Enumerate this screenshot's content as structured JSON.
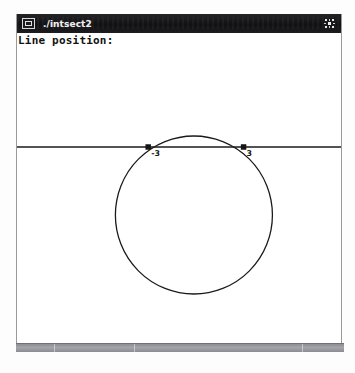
{
  "window": {
    "title": "./intsect2",
    "sysmenu_icon": "window-restore-icon",
    "close_icon": "close-icon",
    "close_label": "X"
  },
  "canvas": {
    "status_label": "Line position:",
    "background_color": "#ffffff",
    "stroke_color": "#1a1a1a"
  },
  "chart_data": {
    "type": "scatter",
    "title": "Line position:",
    "xlabel": "",
    "ylabel": "",
    "grid": false,
    "legend": false,
    "shapes": [
      {
        "kind": "circle",
        "name": "circle",
        "center_px": [
          178,
          196
        ],
        "radius_px": 79,
        "stroke": "#1a1a1a",
        "fill": "none"
      },
      {
        "kind": "line",
        "name": "horizontal-line",
        "y_px": 128,
        "x_start_px": 0,
        "x_end_px": 326,
        "stroke": "#1a1a1a"
      }
    ],
    "points": [
      {
        "name": "left-intersection",
        "label": "-3",
        "x_px": 132,
        "y_px": 128,
        "marker": "square"
      },
      {
        "name": "right-intersection",
        "label": "3",
        "x_px": 228,
        "y_px": 128,
        "marker": "square"
      }
    ],
    "labels": [
      "-3",
      "3"
    ]
  },
  "statusbar": {
    "color": "#9a9ca1",
    "text": ""
  }
}
